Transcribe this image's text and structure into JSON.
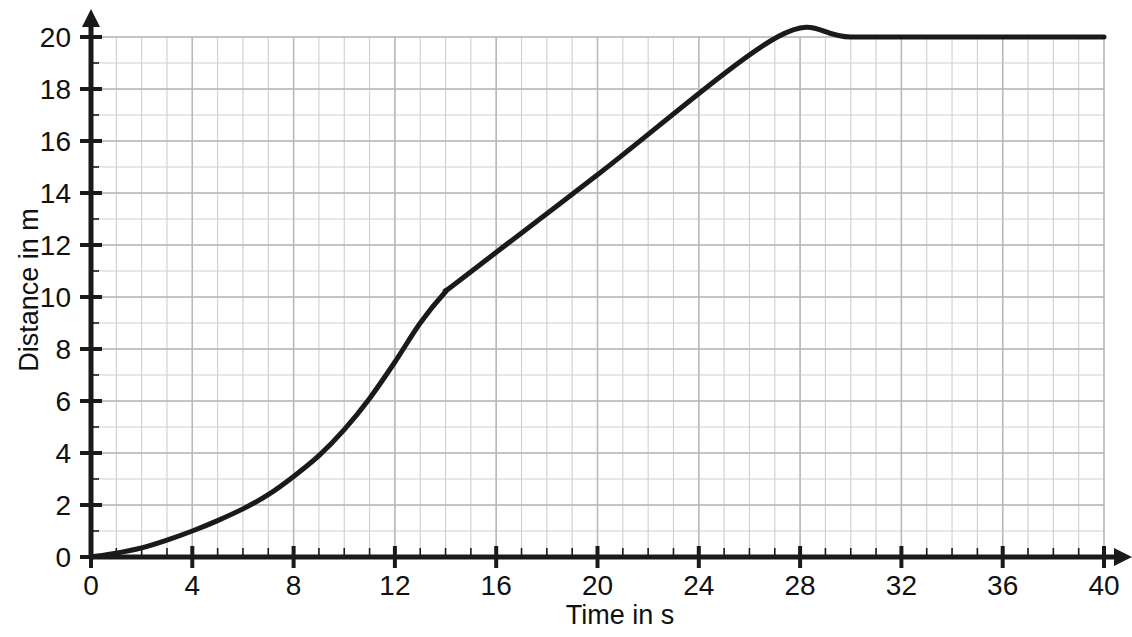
{
  "chart_data": {
    "type": "line",
    "title": "",
    "xlabel": "Time in s",
    "ylabel": "Distance in m",
    "xlim": [
      0,
      40
    ],
    "ylim": [
      0,
      20
    ],
    "grid": "on",
    "grid_minor_step_x": 1,
    "grid_minor_step_y": 1,
    "legend": "none",
    "x_ticks": [
      0,
      4,
      8,
      12,
      16,
      20,
      24,
      28,
      32,
      36,
      40
    ],
    "x_tick_labels": [
      "0",
      "4",
      "8",
      "12",
      "16",
      "20",
      "24",
      "28",
      "32",
      "36",
      "40"
    ],
    "y_ticks": [
      0,
      2,
      4,
      6,
      8,
      10,
      12,
      14,
      16,
      18,
      20
    ],
    "y_tick_labels": [
      "0",
      "2",
      "4",
      "6",
      "8",
      "10",
      "12",
      "14",
      "16",
      "18",
      "20"
    ],
    "x_tick_minor_step": 1,
    "y_tick_minor_step": 1,
    "series": [
      {
        "name": "distance-time",
        "color": "#1a1a1a",
        "line_width": 5,
        "x": [
          0,
          1,
          2,
          3,
          4,
          5,
          6,
          7,
          8,
          9,
          10,
          11,
          12,
          13,
          14,
          14.5,
          20,
          27.1,
          30,
          35,
          40
        ],
        "values": [
          0,
          0.15,
          0.35,
          0.65,
          1.0,
          1.4,
          1.85,
          2.4,
          3.1,
          3.9,
          4.9,
          6.1,
          7.5,
          9.0,
          10.2,
          10.6,
          14.7,
          20,
          20,
          20,
          20
        ]
      }
    ],
    "annotations": [
      {
        "name": "x-axis-arrow",
        "at": [
          40,
          0
        ],
        "direction": "right"
      },
      {
        "name": "y-axis-arrow",
        "at": [
          0,
          20
        ],
        "direction": "up"
      }
    ]
  },
  "colors": {
    "background": "#ffffff",
    "axis": "#1a1a1a",
    "grid_minor": "#cfcfcf",
    "grid_major": "#b8b8b8",
    "curve": "#1a1a1a",
    "text": "#111111"
  }
}
